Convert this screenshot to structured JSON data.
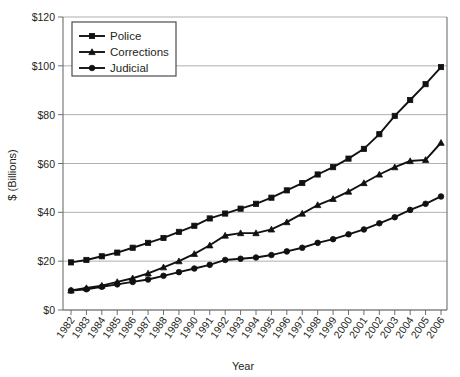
{
  "chart_data": {
    "type": "line",
    "title": "",
    "xlabel": "Year",
    "ylabel": "$ (Billions)",
    "x": [
      1982,
      1983,
      1984,
      1985,
      1986,
      1987,
      1988,
      1989,
      1990,
      1991,
      1992,
      1993,
      1994,
      1995,
      1996,
      1997,
      1998,
      1999,
      2000,
      2001,
      2002,
      2003,
      2004,
      2005,
      2006
    ],
    "categories": [
      "1982",
      "1983",
      "1984",
      "1985",
      "1986",
      "1987",
      "1988",
      "1989",
      "1990",
      "1991",
      "1992",
      "1993",
      "1994",
      "1995",
      "1996",
      "1997",
      "1998",
      "1999",
      "2000",
      "2001",
      "2002",
      "2003",
      "2004",
      "2005",
      "2006"
    ],
    "ylim": [
      0,
      120
    ],
    "yticks": [
      0,
      20,
      40,
      60,
      80,
      100,
      120
    ],
    "ytick_labels": [
      "$0",
      "$20",
      "$40",
      "$60",
      "$80",
      "$100",
      "$120"
    ],
    "grid": true,
    "legend_position": "top-left",
    "series": [
      {
        "name": "Police",
        "marker": "square",
        "values": [
          19.5,
          20.5,
          22.0,
          23.5,
          25.5,
          27.5,
          29.5,
          32.0,
          34.5,
          37.5,
          39.5,
          41.5,
          43.5,
          46.0,
          49.0,
          52.0,
          55.5,
          58.5,
          62.0,
          66.0,
          72.0,
          79.5,
          86.0,
          92.5,
          99.5
        ]
      },
      {
        "name": "Corrections",
        "marker": "triangle",
        "values": [
          8.0,
          9.0,
          10.0,
          11.5,
          13.0,
          15.0,
          17.5,
          20.0,
          23.0,
          26.5,
          30.5,
          31.5,
          31.5,
          33.0,
          36.0,
          39.5,
          43.0,
          45.5,
          48.5,
          52.0,
          55.5,
          58.5,
          61.0,
          61.5,
          68.5
        ]
      },
      {
        "name": "Judicial",
        "marker": "circle",
        "values": [
          8.0,
          8.5,
          9.5,
          10.5,
          11.5,
          12.5,
          14.0,
          15.5,
          17.0,
          18.5,
          20.5,
          21.0,
          21.5,
          22.5,
          24.0,
          25.5,
          27.5,
          29.0,
          31.0,
          33.0,
          35.5,
          38.0,
          41.0,
          43.5,
          46.5
        ]
      }
    ]
  },
  "legend": {
    "items": [
      {
        "label": "Police"
      },
      {
        "label": "Corrections"
      },
      {
        "label": "Judicial"
      }
    ]
  }
}
